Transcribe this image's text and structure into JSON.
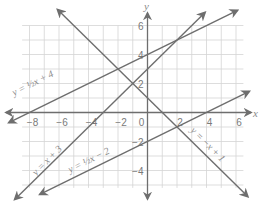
{
  "chart_data": {
    "type": "line",
    "title": "",
    "xlabel": "x",
    "ylabel": "y",
    "xlim": [
      -8.5,
      6.5
    ],
    "ylim": [
      -5,
      6
    ],
    "grid": true,
    "x_ticks": [
      -8,
      -6,
      -4,
      -2,
      0,
      2,
      4,
      6
    ],
    "y_ticks": [
      6,
      4,
      2,
      -2,
      -4
    ],
    "x_tick_labels": [
      "−8",
      "−6",
      "−4",
      "−2",
      "0",
      "2",
      "4",
      "6"
    ],
    "y_tick_labels": [
      "6",
      "4",
      "2",
      "−2",
      "−4"
    ],
    "series": [
      {
        "name": "y = 1/2 x + 4",
        "slope": 0.5,
        "intercept": 4,
        "x_range": [
          -9.4,
          6.1
        ],
        "label_text": "y = ½x + 4"
      },
      {
        "name": "y = x + 3",
        "slope": 1,
        "intercept": 3,
        "x_range": [
          -9.0,
          3.9
        ],
        "label_text": "y = x + 3"
      },
      {
        "name": "y = -x + 1",
        "slope": -1,
        "intercept": 1,
        "x_range": [
          -6.1,
          6.8
        ],
        "label_text": "y = −x + 1"
      },
      {
        "name": "y = 1/2 x - 2",
        "slope": 0.5,
        "intercept": -2,
        "x_range": [
          -7.3,
          6.9
        ],
        "label_text": "y = ½x − 2"
      }
    ],
    "colors": {
      "line": "#6e6e6e",
      "grid": "#d4d4d4",
      "axis": "#6e6e6e",
      "text": "#7a7a7a"
    }
  },
  "labels": {
    "x_axis": "x",
    "y_axis": "y",
    "eq1": "y = ½x + 4",
    "eq2": "y = x + 3",
    "eq3": "y = −x + 1",
    "eq4": "y = ½x − 2"
  }
}
